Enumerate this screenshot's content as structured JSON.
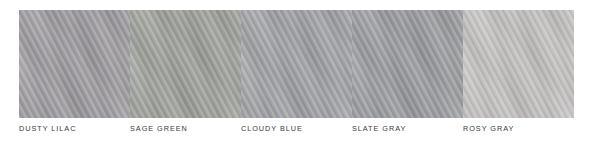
{
  "palette": {
    "background_color": "#ffffff",
    "label_color": "#3a3a3a",
    "swatches": [
      {
        "label": "DUSTY LILAC",
        "color": "#9f9da1"
      },
      {
        "label": "SAGE GREEN",
        "color": "#a0a29d"
      },
      {
        "label": "CLOUDY BLUE",
        "color": "#a1a3a6"
      },
      {
        "label": "SLATE GRAY",
        "color": "#9b9da0"
      },
      {
        "label": "ROSY GRAY",
        "color": "#c5c2c2"
      }
    ]
  }
}
